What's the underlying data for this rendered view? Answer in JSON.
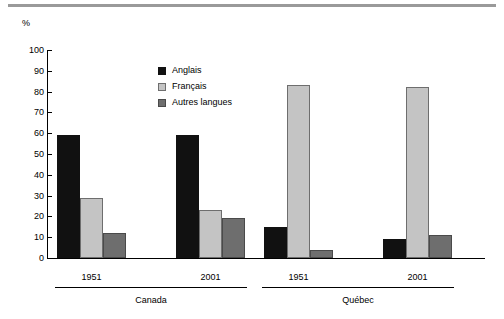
{
  "unit_label": "%",
  "legend": {
    "position": "inside-top-center",
    "items": [
      {
        "label": "Anglais",
        "color": "#111111",
        "key": "anglais"
      },
      {
        "label": "Français",
        "color": "#c4c4c4",
        "key": "francais"
      },
      {
        "label": "Autres langues",
        "color": "#6e6e6e",
        "key": "autres"
      }
    ]
  },
  "axis": {
    "y_ticks": [
      "100",
      "90",
      "80",
      "70",
      "60",
      "50",
      "40",
      "30",
      "20",
      "10",
      "0"
    ],
    "y_min": 0,
    "y_max": 100
  },
  "groups": [
    {
      "region": "Canada",
      "years": [
        "1951",
        "2001"
      ]
    },
    {
      "region": "Québec",
      "years": [
        "1951",
        "2001"
      ]
    }
  ],
  "chart_data": {
    "type": "bar",
    "title": "",
    "subtitle": "",
    "xlabel": "",
    "ylabel": "%",
    "ylim": [
      0,
      100
    ],
    "grid": false,
    "legend_position": "inside-top-center",
    "categories": [
      "Canada 1951",
      "Canada 2001",
      "Québec 1951",
      "Québec 2001"
    ],
    "group_regions": [
      "Canada",
      "Canada",
      "Québec",
      "Québec"
    ],
    "group_years": [
      "1951",
      "2001",
      "1951",
      "2001"
    ],
    "series": [
      {
        "name": "Anglais",
        "color": "#111111",
        "values": [
          59,
          59,
          15,
          9
        ]
      },
      {
        "name": "Français",
        "color": "#c4c4c4",
        "values": [
          29,
          23,
          83,
          82
        ]
      },
      {
        "name": "Autres langues",
        "color": "#6e6e6e",
        "values": [
          12,
          19,
          4,
          11
        ]
      }
    ],
    "y_tick_values": [
      0,
      10,
      20,
      30,
      40,
      50,
      60,
      70,
      80,
      90,
      100
    ],
    "annotations": []
  }
}
